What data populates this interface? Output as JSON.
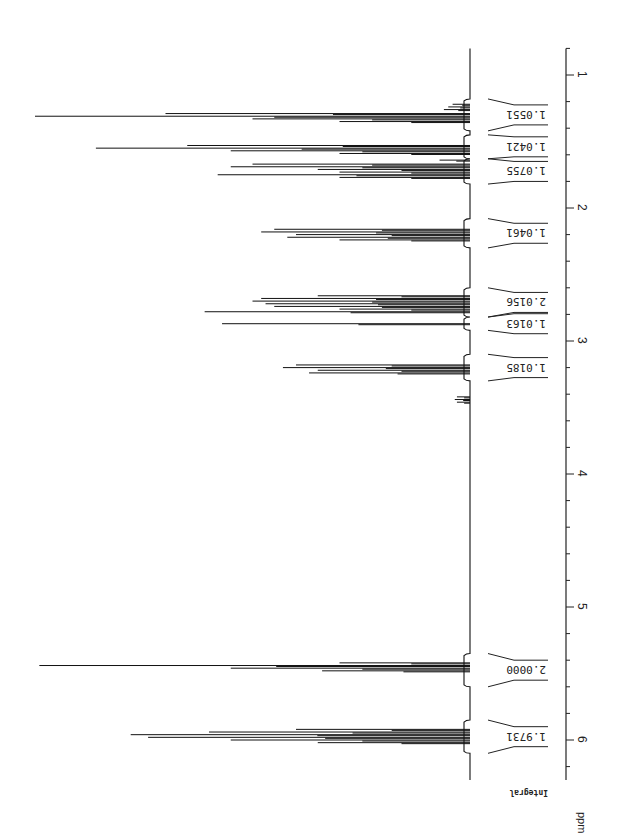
{
  "chart_data": {
    "type": "line",
    "title": "",
    "subtitle": "1H NMR spectrum (rotated 90°)",
    "xlabel": "ppm",
    "ylabel": "",
    "integral_label": "Integral",
    "orientation": "rotated-90-clockwise",
    "axis": {
      "min": 0.8,
      "max": 6.3,
      "major_ticks": [
        1,
        2,
        3,
        4,
        5,
        6
      ],
      "minor_step": 0.2,
      "grid": false
    },
    "peaks": [
      {
        "ppm": 1.22,
        "height": 0.04
      },
      {
        "ppm": 1.24,
        "height": 0.05
      },
      {
        "ppm": 1.26,
        "height": 0.06
      },
      {
        "ppm": 1.29,
        "height": 0.7
      },
      {
        "ppm": 1.31,
        "height": 1.0
      },
      {
        "ppm": 1.33,
        "height": 0.5
      },
      {
        "ppm": 1.35,
        "height": 0.3
      },
      {
        "ppm": 1.53,
        "height": 0.65
      },
      {
        "ppm": 1.55,
        "height": 0.86
      },
      {
        "ppm": 1.57,
        "height": 0.55
      },
      {
        "ppm": 1.59,
        "height": 0.3
      },
      {
        "ppm": 1.64,
        "height": 0.07
      },
      {
        "ppm": 1.67,
        "height": 0.5
      },
      {
        "ppm": 1.69,
        "height": 0.55
      },
      {
        "ppm": 1.71,
        "height": 0.35
      },
      {
        "ppm": 1.73,
        "height": 0.3
      },
      {
        "ppm": 1.75,
        "height": 0.58
      },
      {
        "ppm": 1.77,
        "height": 0.3
      },
      {
        "ppm": 2.16,
        "height": 0.45
      },
      {
        "ppm": 2.18,
        "height": 0.48
      },
      {
        "ppm": 2.2,
        "height": 0.4
      },
      {
        "ppm": 2.22,
        "height": 0.42
      },
      {
        "ppm": 2.24,
        "height": 0.3
      },
      {
        "ppm": 2.66,
        "height": 0.35
      },
      {
        "ppm": 2.68,
        "height": 0.48
      },
      {
        "ppm": 2.7,
        "height": 0.5
      },
      {
        "ppm": 2.72,
        "height": 0.47
      },
      {
        "ppm": 2.74,
        "height": 0.45
      },
      {
        "ppm": 2.76,
        "height": 0.3
      },
      {
        "ppm": 2.78,
        "height": 0.61
      },
      {
        "ppm": 2.87,
        "height": 0.57
      },
      {
        "ppm": 3.18,
        "height": 0.4
      },
      {
        "ppm": 3.2,
        "height": 0.43
      },
      {
        "ppm": 3.22,
        "height": 0.35
      },
      {
        "ppm": 3.24,
        "height": 0.37
      },
      {
        "ppm": 3.42,
        "height": 0.03
      },
      {
        "ppm": 3.44,
        "height": 0.035
      },
      {
        "ppm": 3.46,
        "height": 0.03
      },
      {
        "ppm": 5.42,
        "height": 0.3
      },
      {
        "ppm": 5.44,
        "height": 0.99
      },
      {
        "ppm": 5.46,
        "height": 0.55
      },
      {
        "ppm": 5.48,
        "height": 0.34
      },
      {
        "ppm": 5.92,
        "height": 0.4
      },
      {
        "ppm": 5.94,
        "height": 0.6
      },
      {
        "ppm": 5.96,
        "height": 0.78
      },
      {
        "ppm": 5.98,
        "height": 0.74
      },
      {
        "ppm": 6.0,
        "height": 0.55
      },
      {
        "ppm": 6.02,
        "height": 0.35
      }
    ],
    "integrals": [
      {
        "value": "1.0551",
        "from": 1.18,
        "to": 1.42
      },
      {
        "value": "1.0421",
        "from": 1.45,
        "to": 1.63
      },
      {
        "value": "1.0755",
        "from": 1.63,
        "to": 1.82
      },
      {
        "value": "1.0461",
        "from": 2.08,
        "to": 2.3
      },
      {
        "value": "2.0156",
        "from": 2.6,
        "to": 2.82
      },
      {
        "value": "1.0163",
        "from": 2.82,
        "to": 2.92
      },
      {
        "value": "1.0185",
        "from": 3.1,
        "to": 3.3
      },
      {
        "value": "2.0000",
        "from": 5.35,
        "to": 5.6
      },
      {
        "value": "1.9731",
        "from": 5.85,
        "to": 6.1
      }
    ],
    "legend": null
  },
  "labels": {
    "ppm": "ppm",
    "integral": "Integral",
    "ticks": [
      "1",
      "2",
      "3",
      "4",
      "5",
      "6"
    ]
  }
}
